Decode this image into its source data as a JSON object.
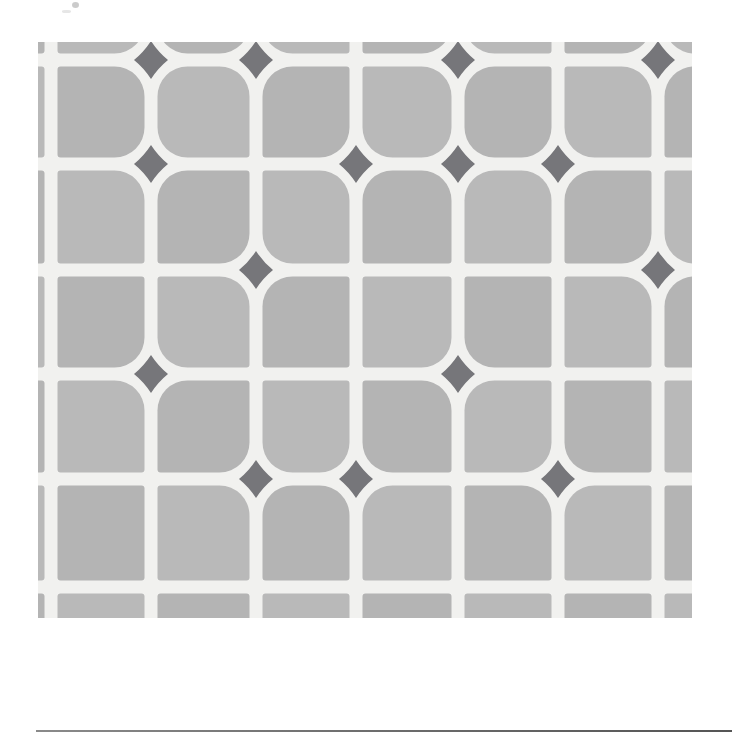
{
  "figure": {
    "kind": "tile-pattern-photograph",
    "caption": "",
    "alt_text": "Gray square tile pattern with white grout lines and dark gray four-pointed star accents at selected intersections"
  },
  "colors": {
    "background": "#ffffff",
    "tile_gray": "#b4b4b4",
    "tile_gray_alt": "#b9b9b9",
    "grout_white": "#f1f1ef",
    "accent_dark_gray": "#76767a",
    "arrow_black": "#1a1a1a",
    "rule_gray": "#6f6f6f"
  },
  "pattern": {
    "origin_x": 38,
    "origin_y": 42,
    "width": 654,
    "height": 576,
    "pitch_x": 100,
    "pitch_y": 104,
    "grout_width": 13,
    "tile_radius_large": 30,
    "tile_radius_small": 3,
    "accent_half_width": 17,
    "accent_half_height": 19,
    "columns": 7,
    "rows": 6,
    "intersections_x": [
      13,
      113,
      218,
      318,
      420,
      520,
      620
    ],
    "intersections_y": [
      18,
      122,
      228,
      332,
      437,
      545
    ],
    "accent_nodes": [
      {
        "col": 1,
        "row": 0
      },
      {
        "col": 2,
        "row": 0
      },
      {
        "col": 4,
        "row": 0
      },
      {
        "col": 6,
        "row": 0
      },
      {
        "col": 1,
        "row": 1
      },
      {
        "col": 3,
        "row": 1
      },
      {
        "col": 4,
        "row": 1
      },
      {
        "col": 5,
        "row": 1
      },
      {
        "col": 2,
        "row": 2
      },
      {
        "col": 6,
        "row": 2
      },
      {
        "col": 1,
        "row": 3
      },
      {
        "col": 4,
        "row": 3
      },
      {
        "col": 2,
        "row": 4
      },
      {
        "col": 3,
        "row": 4
      },
      {
        "col": 5,
        "row": 4
      }
    ]
  },
  "markers": {
    "up_arrow": {
      "label": "up-arrow",
      "glyph": "↑",
      "x": 292,
      "y": 634,
      "width": 40,
      "height": 56
    },
    "down_arrow": {
      "label": "down-arrow",
      "glyph": "↓",
      "x": 396,
      "y": 634,
      "width": 46,
      "height": 58
    }
  },
  "rule": {
    "x": 36,
    "y": 730,
    "width": 696,
    "thickness": 2
  }
}
